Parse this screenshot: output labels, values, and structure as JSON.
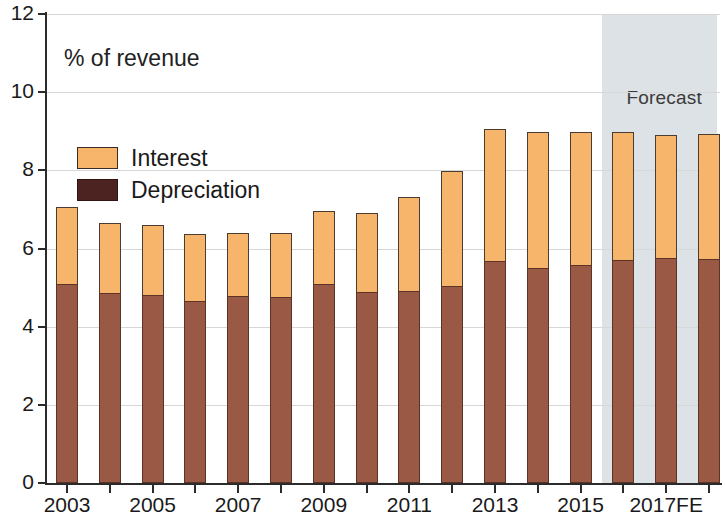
{
  "chart_data": {
    "type": "bar",
    "subtype": "stacked",
    "title": "",
    "axis_title": "% of revenue",
    "xlabel": "",
    "ylabel": "% of revenue",
    "ylim": [
      0,
      12
    ],
    "y_ticks": [
      0,
      2,
      4,
      6,
      8,
      10,
      12
    ],
    "grid": true,
    "grid_axis": "y",
    "legend_position": "upper-left",
    "categories": [
      "2003",
      "2004",
      "2005",
      "2006",
      "2007",
      "2008",
      "2009",
      "2010",
      "2011",
      "2012",
      "2013",
      "2014",
      "2015",
      "2016FE",
      "2017FE",
      "2018FE"
    ],
    "x_tick_labels": [
      "2003",
      "2005",
      "2007",
      "2009",
      "2011",
      "2013",
      "2015",
      "2017FE"
    ],
    "x_tick_label_indices": [
      0,
      2,
      4,
      6,
      8,
      10,
      12,
      14
    ],
    "series": [
      {
        "name": "Depreciation",
        "color": "#9a5945",
        "legend_color": "#4c2321",
        "values": [
          5.1,
          4.85,
          4.8,
          4.65,
          4.78,
          4.75,
          5.08,
          4.88,
          4.9,
          5.05,
          5.68,
          5.5,
          5.58,
          5.7,
          5.75,
          5.72
        ]
      },
      {
        "name": "Interest",
        "color": "#f6b56b",
        "values": [
          1.95,
          1.8,
          1.8,
          1.73,
          1.62,
          1.65,
          1.87,
          2.04,
          2.42,
          2.93,
          3.37,
          3.48,
          3.39,
          3.28,
          3.15,
          3.2
        ]
      }
    ],
    "totals": [
      7.05,
      6.65,
      6.6,
      6.38,
      6.4,
      6.4,
      6.95,
      6.92,
      7.32,
      7.98,
      9.05,
      8.98,
      8.97,
      8.98,
      8.9,
      8.92
    ],
    "annotations": [
      {
        "text": "Forecast",
        "type": "shaded-region-label",
        "region_start_category": "2016FE",
        "region_end_category": "2018FE",
        "region_color": "#d9e0e3"
      }
    ]
  },
  "legend": {
    "entries": [
      {
        "label": "Interest",
        "swatch": "interest-swatch"
      },
      {
        "label": "Depreciation",
        "swatch": "depreciation-swatch"
      }
    ]
  }
}
